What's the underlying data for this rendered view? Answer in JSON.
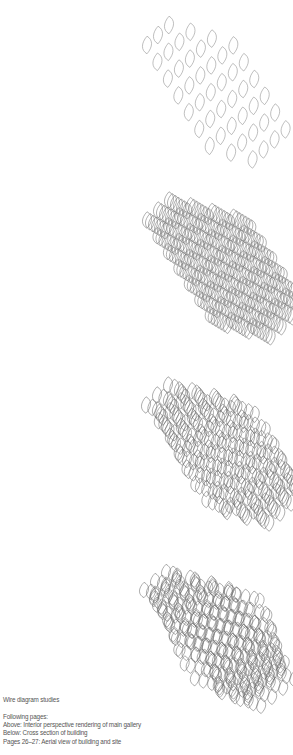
{
  "caption": {
    "title": "Wire diagram studies",
    "following_label": "Following pages:",
    "lines": [
      "Above: Interior perspective rendering of main gallery",
      "Below: Cross section of building",
      "Pages 26–27: Aerial view of building and site"
    ]
  },
  "figures": [
    {
      "name": "wire-diagram-1",
      "layers": 1,
      "cols": 6,
      "rows": 9,
      "x0": 147,
      "y0": 45,
      "dx": 11,
      "dy": 10,
      "cellH": 16,
      "layerShift": 0,
      "warp": 0,
      "bend": 0,
      "stroke": "#8a8a8a"
    },
    {
      "name": "wire-diagram-2",
      "layers": 7,
      "cols": 6,
      "rows": 9,
      "x0": 147,
      "y0": 220,
      "dx": 11,
      "dy": 10,
      "cellH": 15,
      "layerShift": 3,
      "warp": 0,
      "bend": 0,
      "stroke": "#6f6f6f"
    },
    {
      "name": "wire-diagram-3",
      "layers": 6,
      "cols": 6,
      "rows": 9,
      "x0": 146,
      "y0": 405,
      "dx": 11,
      "dy": 10,
      "cellH": 15,
      "layerShift": 4,
      "warp": 3,
      "bend": 0,
      "stroke": "#6a6a6a"
    },
    {
      "name": "wire-diagram-4",
      "layers": 7,
      "cols": 6,
      "rows": 9,
      "x0": 144,
      "y0": 590,
      "dx": 11,
      "dy": 9,
      "cellH": 14,
      "layerShift": 3,
      "warp": 5,
      "bend": 1,
      "stroke": "#6a6a6a"
    }
  ]
}
